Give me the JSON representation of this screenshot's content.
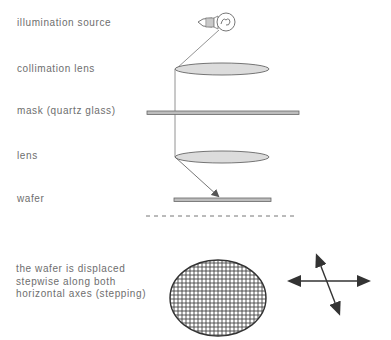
{
  "labels": {
    "illumination_source": "illumination source",
    "collimation_lens": "collimation lens",
    "mask": "mask (quartz glass)",
    "lens": "lens",
    "wafer": "wafer"
  },
  "caption": {
    "line1": "the wafer is displaced",
    "line2": "stepwise along both",
    "line3": "horizontal axes (stepping)"
  },
  "colors": {
    "text": "#6e6e6e",
    "lens_fill": "#d9d9d9",
    "stroke": "#555555",
    "bar_fill": "#b8b8b8"
  }
}
